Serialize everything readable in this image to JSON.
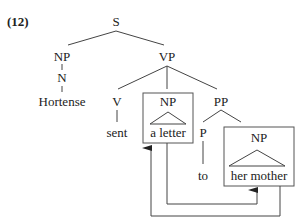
{
  "example_number": "(12)",
  "tree": {
    "root": "S",
    "subject_np": {
      "label": "NP",
      "noun": "N",
      "word": "Hortense"
    },
    "vp": {
      "label": "VP",
      "verb": {
        "label": "V",
        "word": "sent"
      },
      "object_np": {
        "label": "NP",
        "word": "a letter",
        "boxed": true
      },
      "pp": {
        "label": "PP",
        "prep": {
          "label": "P",
          "word": "to"
        },
        "np": {
          "label": "NP",
          "word": "her mother",
          "boxed": true
        }
      }
    }
  },
  "arrows": [
    {
      "from": "a letter",
      "to": "her mother"
    },
    {
      "from": "her mother",
      "to": "a letter"
    }
  ],
  "colors": {
    "line": "#444444",
    "text": "#222222",
    "background": "#ffffff"
  }
}
